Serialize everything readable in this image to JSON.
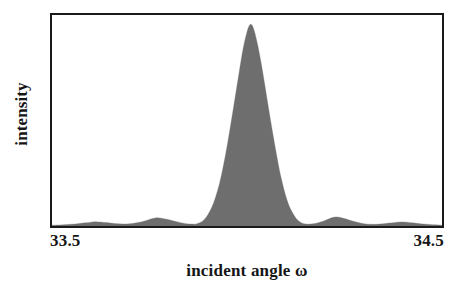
{
  "chart_data": {
    "type": "area",
    "title": "",
    "subtitle": "",
    "xlabel": "incident angle ω",
    "ylabel": "intensity",
    "xlim": [
      33.5,
      34.5
    ],
    "ylim": [
      0,
      1
    ],
    "xtick_labels": [
      "33.5",
      "34.5"
    ],
    "xticks": [
      33.5,
      34.5
    ],
    "ytick_labels": [],
    "grid": false,
    "legend": false,
    "legend_position": "none",
    "annotations": [],
    "series": [
      {
        "name": "rocking curve",
        "fill_color": "#6e6e6e",
        "line_color": "#6e6e6e",
        "description": "Symmetric diffraction rocking curve: one tall central peak near 34.0 with small interference side fringes on both flanks.",
        "peak_center": 34.0,
        "peak_height": 0.955,
        "points": [
          {
            "x": 33.5,
            "y": 0.004
          },
          {
            "x": 33.52,
            "y": 0.005
          },
          {
            "x": 33.54,
            "y": 0.007
          },
          {
            "x": 33.56,
            "y": 0.01
          },
          {
            "x": 33.58,
            "y": 0.014
          },
          {
            "x": 33.6,
            "y": 0.018
          },
          {
            "x": 33.61,
            "y": 0.02
          },
          {
            "x": 33.62,
            "y": 0.019
          },
          {
            "x": 33.64,
            "y": 0.016
          },
          {
            "x": 33.66,
            "y": 0.012
          },
          {
            "x": 33.68,
            "y": 0.01
          },
          {
            "x": 33.7,
            "y": 0.011
          },
          {
            "x": 33.72,
            "y": 0.016
          },
          {
            "x": 33.74,
            "y": 0.025
          },
          {
            "x": 33.755,
            "y": 0.034
          },
          {
            "x": 33.768,
            "y": 0.039
          },
          {
            "x": 33.78,
            "y": 0.037
          },
          {
            "x": 33.8,
            "y": 0.03
          },
          {
            "x": 33.82,
            "y": 0.02
          },
          {
            "x": 33.84,
            "y": 0.012
          },
          {
            "x": 33.86,
            "y": 0.009
          },
          {
            "x": 33.87,
            "y": 0.01
          },
          {
            "x": 33.88,
            "y": 0.016
          },
          {
            "x": 33.89,
            "y": 0.03
          },
          {
            "x": 33.9,
            "y": 0.055
          },
          {
            "x": 33.91,
            "y": 0.09
          },
          {
            "x": 33.92,
            "y": 0.14
          },
          {
            "x": 33.93,
            "y": 0.205
          },
          {
            "x": 33.94,
            "y": 0.29
          },
          {
            "x": 33.95,
            "y": 0.39
          },
          {
            "x": 33.96,
            "y": 0.5
          },
          {
            "x": 33.97,
            "y": 0.615
          },
          {
            "x": 33.98,
            "y": 0.73
          },
          {
            "x": 33.99,
            "y": 0.84
          },
          {
            "x": 34.0,
            "y": 0.92
          },
          {
            "x": 34.008,
            "y": 0.955
          },
          {
            "x": 34.016,
            "y": 0.94
          },
          {
            "x": 34.026,
            "y": 0.87
          },
          {
            "x": 34.036,
            "y": 0.775
          },
          {
            "x": 34.046,
            "y": 0.665
          },
          {
            "x": 34.056,
            "y": 0.55
          },
          {
            "x": 34.066,
            "y": 0.44
          },
          {
            "x": 34.076,
            "y": 0.335
          },
          {
            "x": 34.086,
            "y": 0.24
          },
          {
            "x": 34.096,
            "y": 0.165
          },
          {
            "x": 34.106,
            "y": 0.105
          },
          {
            "x": 34.116,
            "y": 0.065
          },
          {
            "x": 34.126,
            "y": 0.036
          },
          {
            "x": 34.136,
            "y": 0.019
          },
          {
            "x": 34.146,
            "y": 0.011
          },
          {
            "x": 34.16,
            "y": 0.009
          },
          {
            "x": 34.18,
            "y": 0.014
          },
          {
            "x": 34.2,
            "y": 0.026
          },
          {
            "x": 34.215,
            "y": 0.038
          },
          {
            "x": 34.228,
            "y": 0.043
          },
          {
            "x": 34.24,
            "y": 0.04
          },
          {
            "x": 34.26,
            "y": 0.03
          },
          {
            "x": 34.28,
            "y": 0.019
          },
          {
            "x": 34.3,
            "y": 0.011
          },
          {
            "x": 34.32,
            "y": 0.008
          },
          {
            "x": 34.34,
            "y": 0.009
          },
          {
            "x": 34.36,
            "y": 0.013
          },
          {
            "x": 34.38,
            "y": 0.017
          },
          {
            "x": 34.395,
            "y": 0.019
          },
          {
            "x": 34.41,
            "y": 0.018
          },
          {
            "x": 34.43,
            "y": 0.014
          },
          {
            "x": 34.45,
            "y": 0.01
          },
          {
            "x": 34.47,
            "y": 0.007
          },
          {
            "x": 34.49,
            "y": 0.005
          },
          {
            "x": 34.5,
            "y": 0.004
          }
        ]
      }
    ]
  },
  "style": {
    "frame_color": "#1a1a1a",
    "background": "#ffffff",
    "text_color": "#161616",
    "fill_color": "#6e6e6e"
  }
}
